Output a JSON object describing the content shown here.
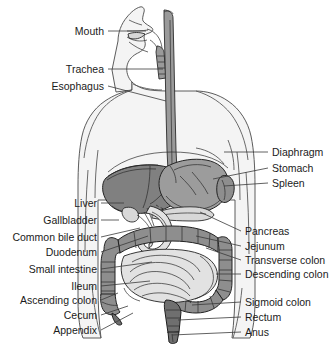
{
  "figure": {
    "background_color": "#ffffff",
    "width": 334,
    "height": 353
  },
  "palette": {
    "body_fill": "#f4f4f4",
    "body_outline": "#4a4a4a",
    "liver": "#808080",
    "stomach": "#9c9c9c",
    "colon": "#8e8e8e",
    "small_intestine": "#e2e2e2",
    "pancreas": "#d8d8d8",
    "esophagus": "#9a9a9a",
    "rectum": "#6f6f6f",
    "leader_line": "#3a3a3a",
    "label_text": "#1b1b1b"
  },
  "labels_left": [
    {
      "id": "mouth",
      "text": "Mouth",
      "text_x": 104,
      "text_y": 35,
      "line": "M108,31 L146,31"
    },
    {
      "id": "trachea",
      "text": "Trachea",
      "text_x": 104,
      "text_y": 73,
      "line": "M108,69 L163,69"
    },
    {
      "id": "esophagus",
      "text": "Esophagus",
      "text_x": 104,
      "text_y": 90,
      "line": "M108,86 L166,101"
    },
    {
      "id": "liver",
      "text": "Liver",
      "text_x": 97,
      "text_y": 207,
      "line": "M101,203 L124,203"
    },
    {
      "id": "gallbladder",
      "text": "Gallbladder",
      "text_x": 97,
      "text_y": 224,
      "line": "M101,220 L119,220"
    },
    {
      "id": "common-bile-duct",
      "text": "Common bile duct",
      "text_x": 97,
      "text_y": 241,
      "line": "M101,237 L140,228"
    },
    {
      "id": "duodenum",
      "text": "Duodenum",
      "text_x": 97,
      "text_y": 256,
      "line": "M101,252 L148,236"
    },
    {
      "id": "small-intestine",
      "text": "Small intestine",
      "text_x": 97,
      "text_y": 273,
      "line": "M101,269 L152,262"
    },
    {
      "id": "ileum",
      "text": "Ileum",
      "text_x": 97,
      "text_y": 290,
      "line": "M101,286 L150,281"
    },
    {
      "id": "ascending-colon",
      "text": "Ascending colon",
      "text_x": 97,
      "text_y": 304,
      "line": "M101,300 L118,293"
    },
    {
      "id": "cecum",
      "text": "Cecum",
      "text_x": 97,
      "text_y": 319,
      "line": "M101,315 L128,306"
    },
    {
      "id": "appendix",
      "text": "Appendix",
      "text_x": 97,
      "text_y": 334,
      "line": "M101,330 L133,313"
    }
  ],
  "labels_right": [
    {
      "id": "diaphragm",
      "text": "Diaphragm",
      "text_x": 272,
      "text_y": 156,
      "line": "M268,152 L224,152"
    },
    {
      "id": "stomach",
      "text": "Stomach",
      "text_x": 272,
      "text_y": 172,
      "line": "M268,168 L213,179"
    },
    {
      "id": "spleen",
      "text": "Spleen",
      "text_x": 272,
      "text_y": 187,
      "line": "M268,183 L224,186"
    },
    {
      "id": "pancreas",
      "text": "Pancreas",
      "text_x": 245,
      "text_y": 235,
      "line": "M241,231 L200,212"
    },
    {
      "id": "jejunum",
      "text": "Jejunum",
      "text_x": 245,
      "text_y": 250,
      "line": "M241,246 L196,236"
    },
    {
      "id": "transverse-colon",
      "text": "Transverse colon",
      "text_x": 245,
      "text_y": 264,
      "line": "M241,260 L206,248"
    },
    {
      "id": "descending-colon",
      "text": "Descending colon",
      "text_x": 245,
      "text_y": 278,
      "line": "M241,274 L216,274"
    },
    {
      "id": "sigmoid-colon",
      "text": "Sigmoid colon",
      "text_x": 245,
      "text_y": 306,
      "line": "M241,302 L192,305"
    },
    {
      "id": "rectum",
      "text": "Rectum",
      "text_x": 245,
      "text_y": 321,
      "line": "M241,317 L178,320"
    },
    {
      "id": "anus",
      "text": "Anus",
      "text_x": 245,
      "text_y": 336,
      "line": "M241,332 L172,335"
    }
  ],
  "organs": [
    {
      "id": "head-profile",
      "name": "head-profile"
    },
    {
      "id": "torso",
      "name": "torso-silhouette"
    },
    {
      "id": "esophagus-tube",
      "name": "esophagus"
    },
    {
      "id": "trachea-tube",
      "name": "trachea"
    },
    {
      "id": "liver-mass",
      "name": "liver"
    },
    {
      "id": "stomach-sac",
      "name": "stomach"
    },
    {
      "id": "spleen-body",
      "name": "spleen"
    },
    {
      "id": "diaphragm-arc",
      "name": "diaphragm"
    },
    {
      "id": "gallbladder-body",
      "name": "gallbladder"
    },
    {
      "id": "pancreas-body",
      "name": "pancreas"
    },
    {
      "id": "duodenum-loop",
      "name": "duodenum"
    },
    {
      "id": "transverse-colon-seg",
      "name": "transverse-colon"
    },
    {
      "id": "ascending-colon-seg",
      "name": "ascending-colon"
    },
    {
      "id": "descending-colon-seg",
      "name": "descending-colon"
    },
    {
      "id": "sigmoid-colon-seg",
      "name": "sigmoid-colon"
    },
    {
      "id": "cecum-body",
      "name": "cecum"
    },
    {
      "id": "appendix-body",
      "name": "appendix"
    },
    {
      "id": "small-intestine-coils",
      "name": "small-intestine"
    },
    {
      "id": "rectum-tube",
      "name": "rectum"
    },
    {
      "id": "anus-opening",
      "name": "anus"
    }
  ]
}
